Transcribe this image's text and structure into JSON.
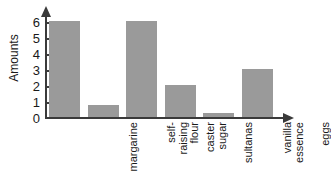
{
  "chart_data": {
    "type": "bar",
    "title": "",
    "xlabel": "",
    "ylabel": "Amounts",
    "categories": [
      "margarine",
      "self-raising flour",
      "caster sugar",
      "sultanas",
      "vanilla essence",
      "eggs"
    ],
    "category_lines": [
      [
        "margarine"
      ],
      [
        "self-",
        "raising",
        "flour"
      ],
      [
        "caster",
        "sugar"
      ],
      [
        "sultanas"
      ],
      [
        "vanilla",
        "essence"
      ],
      [
        "eggs"
      ]
    ],
    "values": [
      6,
      0.75,
      6,
      2,
      0.25,
      3
    ],
    "ylim": [
      0,
      6
    ],
    "yticks": [
      0,
      1,
      2,
      3,
      4,
      5,
      6
    ],
    "ytick_labels": [
      "0",
      "1",
      "2",
      "3",
      "4",
      "5",
      "6"
    ],
    "grid": false,
    "legend": false,
    "bar_color": "#9a9a9a",
    "axis_color": "#3a3a3a",
    "background": "#ffffff"
  }
}
